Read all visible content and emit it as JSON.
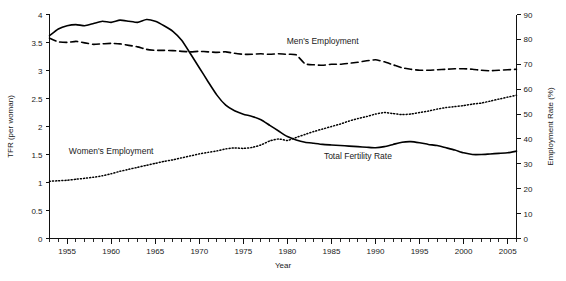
{
  "chart_data": {
    "type": "line",
    "title": "",
    "subtitle": "",
    "xlabel": "Year",
    "ylabel": "TFR (per woman)",
    "y2label": "Employment Rate (%)",
    "xlim": [
      1953,
      2006
    ],
    "ylim": [
      0,
      4
    ],
    "y2lim": [
      0,
      90
    ],
    "grid": false,
    "legend_position": "inline-annotations",
    "x_major_ticks": [
      1955,
      1960,
      1965,
      1970,
      1975,
      1980,
      1985,
      1990,
      1995,
      2000,
      2005
    ],
    "x_tick_labels": [
      "1955",
      "1960",
      "1965",
      "1970",
      "1975",
      "1980",
      "1985",
      "1990",
      "1995",
      "2000",
      "2005"
    ],
    "x_minor_tick_step": 1,
    "y_ticks": [
      0,
      0.5,
      1,
      1.5,
      2,
      2.5,
      3,
      3.5,
      4
    ],
    "y_tick_labels": [
      "0",
      "0.5",
      "1",
      "1.5",
      "2",
      "2.5",
      "3",
      "3.5",
      "4"
    ],
    "y2_ticks": [
      0,
      10,
      20,
      30,
      40,
      50,
      60,
      70,
      80,
      90
    ],
    "y2_tick_labels": [
      "0",
      "10",
      "20",
      "30",
      "40",
      "50",
      "60",
      "70",
      "80",
      "90"
    ],
    "x": [
      1953,
      1954,
      1955,
      1956,
      1957,
      1958,
      1959,
      1960,
      1961,
      1962,
      1963,
      1964,
      1965,
      1966,
      1967,
      1968,
      1969,
      1970,
      1971,
      1972,
      1973,
      1974,
      1975,
      1976,
      1977,
      1978,
      1979,
      1980,
      1981,
      1982,
      1983,
      1984,
      1985,
      1986,
      1987,
      1988,
      1989,
      1990,
      1991,
      1992,
      1993,
      1994,
      1995,
      1996,
      1997,
      1998,
      1999,
      2000,
      2001,
      2002,
      2003,
      2004,
      2005,
      2006
    ],
    "series": [
      {
        "name": "Total Fertility Rate",
        "axis": "left",
        "style": "solid",
        "label_x": 1988,
        "label_y": 1.42,
        "units": "children per woman",
        "values": [
          3.62,
          3.74,
          3.8,
          3.82,
          3.8,
          3.84,
          3.88,
          3.86,
          3.9,
          3.88,
          3.86,
          3.91,
          3.88,
          3.8,
          3.7,
          3.54,
          3.3,
          3.05,
          2.8,
          2.56,
          2.38,
          2.28,
          2.22,
          2.18,
          2.12,
          2.02,
          1.92,
          1.82,
          1.76,
          1.72,
          1.7,
          1.68,
          1.67,
          1.66,
          1.65,
          1.64,
          1.63,
          1.62,
          1.64,
          1.68,
          1.72,
          1.73,
          1.71,
          1.68,
          1.66,
          1.62,
          1.58,
          1.53,
          1.5,
          1.5,
          1.51,
          1.52,
          1.53,
          1.56
        ]
      },
      {
        "name": "Men's Employment",
        "axis": "right",
        "style": "dashed",
        "label_x": 1984,
        "label_y_pct": 78,
        "units": "percent",
        "values": [
          80.5,
          79.0,
          78.8,
          79.2,
          78.6,
          78.0,
          78.2,
          78.4,
          78.2,
          77.6,
          77.0,
          76.0,
          75.6,
          75.6,
          75.5,
          75.2,
          75.0,
          75.2,
          75.0,
          74.8,
          75.0,
          74.4,
          74.0,
          74.0,
          74.2,
          74.0,
          74.2,
          74.0,
          73.8,
          70.2,
          69.8,
          69.6,
          70.0,
          70.0,
          70.4,
          70.8,
          71.4,
          71.8,
          71.0,
          69.8,
          68.6,
          68.0,
          67.6,
          67.6,
          67.8,
          68.0,
          68.2,
          68.2,
          68.0,
          67.6,
          67.4,
          67.6,
          67.8,
          68.0
        ]
      },
      {
        "name": "Women's Employment",
        "axis": "right",
        "style": "dotted",
        "label_x": 1960,
        "label_y_pct": 34,
        "units": "percent",
        "values": [
          23.0,
          23.2,
          23.4,
          23.8,
          24.2,
          24.6,
          25.2,
          26.0,
          27.0,
          27.8,
          28.6,
          29.4,
          30.2,
          31.0,
          31.6,
          32.4,
          33.2,
          34.0,
          34.6,
          35.2,
          36.0,
          36.4,
          36.2,
          36.6,
          37.6,
          39.2,
          40.0,
          39.4,
          40.6,
          41.8,
          43.0,
          44.0,
          45.0,
          46.0,
          47.2,
          48.2,
          49.0,
          50.0,
          50.6,
          50.2,
          49.8,
          50.0,
          50.6,
          51.2,
          52.0,
          52.6,
          53.0,
          53.4,
          54.0,
          54.4,
          55.2,
          56.0,
          56.8,
          57.6
        ]
      }
    ]
  },
  "annotations": {
    "men_label": "Men's Employment",
    "women_label": "Women's Employment",
    "tfr_label": "Total Fertility Rate"
  }
}
